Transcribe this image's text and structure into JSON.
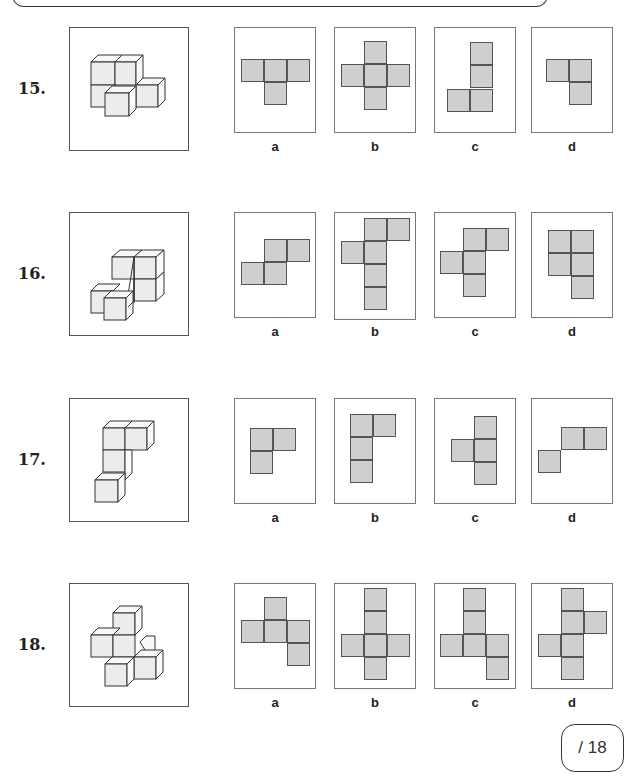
{
  "worksheet": {
    "score_label": "/ 18"
  },
  "questions": [
    {
      "number": "15.",
      "shape_icon": "isometric-cube-stack-15",
      "options": [
        {
          "label": "a",
          "cells": [
            [
              0,
              0
            ],
            [
              1,
              0
            ],
            [
              2,
              0
            ],
            [
              1,
              1
            ]
          ]
        },
        {
          "label": "b",
          "cells": [
            [
              1,
              0
            ],
            [
              0,
              1
            ],
            [
              1,
              1
            ],
            [
              2,
              1
            ],
            [
              1,
              2
            ]
          ]
        },
        {
          "label": "c",
          "cells": [
            [
              1,
              0
            ],
            [
              1,
              1
            ],
            [
              0,
              2
            ],
            [
              1,
              2
            ]
          ]
        },
        {
          "label": "d",
          "cells": [
            [
              0,
              0
            ],
            [
              1,
              0
            ],
            [
              1,
              1
            ]
          ]
        }
      ]
    },
    {
      "number": "16.",
      "shape_icon": "isometric-cube-stack-16",
      "options": [
        {
          "label": "a",
          "cells": [
            [
              1,
              0
            ],
            [
              2,
              0
            ],
            [
              0,
              1
            ],
            [
              1,
              1
            ]
          ]
        },
        {
          "label": "b",
          "cells": [
            [
              1,
              0
            ],
            [
              2,
              0
            ],
            [
              0,
              1
            ],
            [
              1,
              1
            ],
            [
              1,
              2
            ],
            [
              1,
              3
            ]
          ]
        },
        {
          "label": "c",
          "cells": [
            [
              1,
              0
            ],
            [
              2,
              0
            ],
            [
              0,
              1
            ],
            [
              1,
              1
            ],
            [
              1,
              2
            ]
          ]
        },
        {
          "label": "d",
          "cells": [
            [
              0,
              0
            ],
            [
              1,
              0
            ],
            [
              0,
              1
            ],
            [
              1,
              1
            ],
            [
              1,
              2
            ]
          ]
        }
      ]
    },
    {
      "number": "17.",
      "shape_icon": "isometric-cube-stack-17",
      "options": [
        {
          "label": "a",
          "cells": [
            [
              0,
              0
            ],
            [
              1,
              0
            ],
            [
              0,
              1
            ]
          ]
        },
        {
          "label": "b",
          "cells": [
            [
              0,
              0
            ],
            [
              1,
              0
            ],
            [
              0,
              1
            ],
            [
              0,
              2
            ]
          ]
        },
        {
          "label": "c",
          "cells": [
            [
              1,
              0
            ],
            [
              0,
              1
            ],
            [
              1,
              1
            ],
            [
              1,
              2
            ]
          ]
        },
        {
          "label": "d",
          "cells": [
            [
              1,
              0
            ],
            [
              2,
              0
            ],
            [
              0,
              1
            ]
          ]
        }
      ]
    },
    {
      "number": "18.",
      "shape_icon": "isometric-cube-stack-18",
      "options": [
        {
          "label": "a",
          "cells": [
            [
              1,
              0
            ],
            [
              0,
              1
            ],
            [
              1,
              1
            ],
            [
              2,
              1
            ],
            [
              2,
              2
            ]
          ]
        },
        {
          "label": "b",
          "cells": [
            [
              1,
              0
            ],
            [
              1,
              1
            ],
            [
              0,
              2
            ],
            [
              1,
              2
            ],
            [
              2,
              2
            ],
            [
              1,
              3
            ]
          ]
        },
        {
          "label": "c",
          "cells": [
            [
              1,
              0
            ],
            [
              1,
              1
            ],
            [
              0,
              2
            ],
            [
              1,
              2
            ],
            [
              2,
              2
            ],
            [
              2,
              3
            ]
          ]
        },
        {
          "label": "d",
          "cells": [
            [
              1,
              0
            ],
            [
              1,
              1
            ],
            [
              2,
              1
            ],
            [
              0,
              2
            ],
            [
              1,
              2
            ],
            [
              1,
              3
            ]
          ]
        }
      ]
    }
  ]
}
